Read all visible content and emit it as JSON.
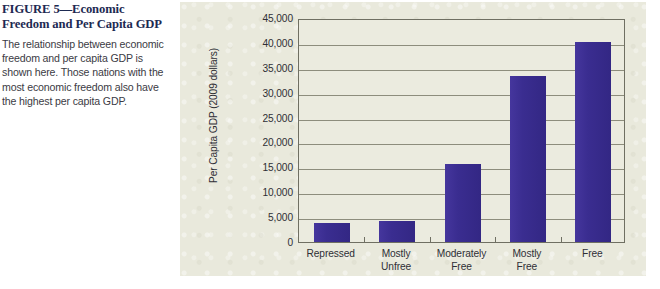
{
  "caption": {
    "title": "FIGURE 5—Economic Freedom and Per Capita GDP",
    "description": "The relationship between economic freedom and per capita GDP is shown here. Those nations with the most economic freedom also have the highest per capita GDP."
  },
  "colors": {
    "bar": "#3a2d90",
    "panel_background": "#e9e9dc",
    "plot_background": "#ebebdf",
    "gridline": "#8d8d7d",
    "axis": "#6f6f62",
    "title_text": "#1d2a52",
    "body_text": "#3b3b44",
    "tick_text": "#2f2f36"
  },
  "chart_data": {
    "type": "bar",
    "title": "",
    "xlabel": "",
    "ylabel": "Per Capita GDP (2009 dollars)",
    "categories": [
      "Repressed",
      "Mostly Unfree",
      "Moderately Free",
      "Mostly Free",
      "Free"
    ],
    "category_lines": [
      [
        "Repressed"
      ],
      [
        "Mostly",
        "Unfree"
      ],
      [
        "Moderately",
        "Free"
      ],
      [
        "Mostly",
        "Free"
      ],
      [
        "Free"
      ]
    ],
    "values": [
      3900,
      4300,
      15600,
      33400,
      40200
    ],
    "ylim": [
      0,
      45000
    ],
    "ytick_values": [
      0,
      5000,
      10000,
      15000,
      20000,
      25000,
      30000,
      35000,
      40000,
      45000
    ],
    "ytick_labels": [
      "0",
      "5,000",
      "10,000",
      "15,000",
      "20,000",
      "25,000",
      "30,000",
      "35,000",
      "40,000",
      "45,000"
    ],
    "grid": true,
    "legend": null
  }
}
